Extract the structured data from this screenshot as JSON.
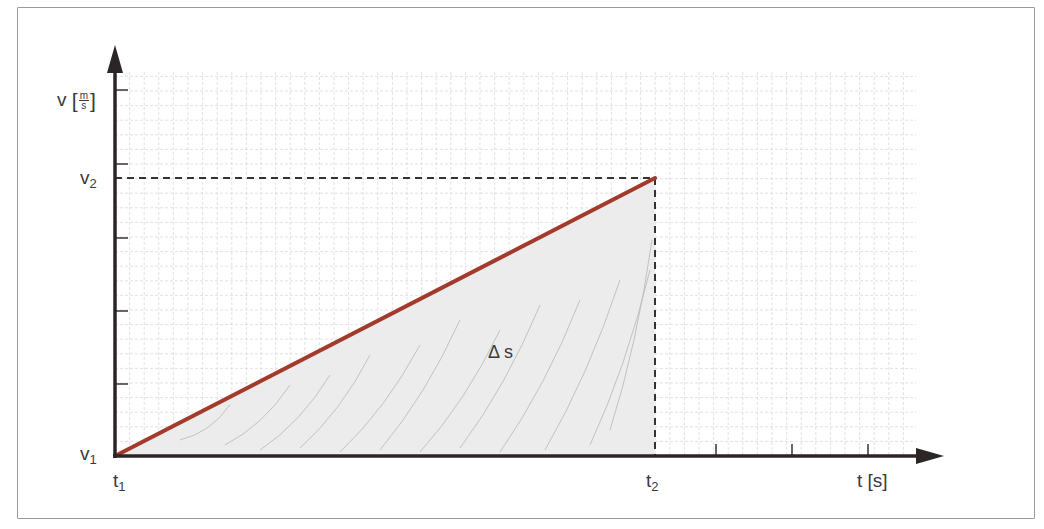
{
  "diagram": {
    "y_axis": {
      "symbol": "v",
      "unit_numerator": "m",
      "unit_denominator": "s",
      "bracket_open": "[",
      "bracket_close": "]"
    },
    "x_axis": {
      "label": "t [s]"
    },
    "points": {
      "v1": {
        "base": "v",
        "sub": "1"
      },
      "v2": {
        "base": "v",
        "sub": "2"
      },
      "t1": {
        "base": "t",
        "sub": "1"
      },
      "t2": {
        "base": "t",
        "sub": "2"
      }
    },
    "area_label": "Δ s",
    "colors": {
      "axis": "#2b2526",
      "line": "#a33a2c",
      "area_fill": "#ececec",
      "grid": "#d6d6d6",
      "dashed": "#333333",
      "text": "#3a3a3a",
      "frame": "#9a9a9a"
    },
    "geometry": {
      "origin": [
        115,
        456
      ],
      "end_point": [
        655,
        178
      ],
      "y_ticks": [
        90,
        164,
        238,
        311,
        384
      ],
      "x_ticks": [
        716,
        792,
        868
      ],
      "grid_right": 916,
      "grid_top": 72,
      "grid_step": 14.6
    }
  }
}
